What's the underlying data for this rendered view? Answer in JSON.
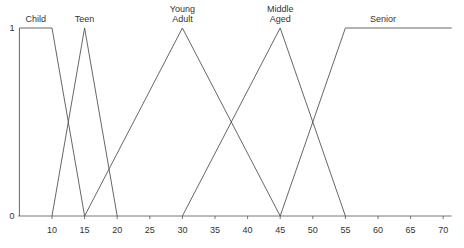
{
  "chart_data": {
    "type": "line",
    "title": "",
    "xlabel": "",
    "ylabel": "",
    "xlim": [
      4.8,
      71.3
    ],
    "ylim": [
      0,
      1
    ],
    "grid": false,
    "legend": "none (series labeled inline above peaks)",
    "x_ticks": [
      10,
      15,
      20,
      25,
      30,
      35,
      40,
      45,
      50,
      55,
      60,
      65,
      70
    ],
    "y_ticks": [
      0,
      1
    ],
    "series": [
      {
        "name": "Child",
        "label_lines": [
          "Child"
        ],
        "points": [
          [
            5,
            0
          ],
          [
            5,
            1
          ],
          [
            10,
            1
          ],
          [
            15,
            0
          ]
        ]
      },
      {
        "name": "Teen",
        "label_lines": [
          "Teen"
        ],
        "points": [
          [
            10,
            0
          ],
          [
            15,
            1
          ],
          [
            20,
            0
          ]
        ]
      },
      {
        "name": "Young Adult",
        "label_lines": [
          "Young",
          "Adult"
        ],
        "points": [
          [
            15,
            0
          ],
          [
            30,
            1
          ],
          [
            45,
            0
          ]
        ]
      },
      {
        "name": "Middle Aged",
        "label_lines": [
          "Middle",
          "Aged"
        ],
        "points": [
          [
            30,
            0
          ],
          [
            45,
            1
          ],
          [
            55,
            0
          ]
        ]
      },
      {
        "name": "Senior",
        "label_lines": [
          "Senior"
        ],
        "points": [
          [
            45,
            0
          ],
          [
            55,
            1
          ],
          [
            71.3,
            1
          ]
        ]
      }
    ]
  },
  "style": {
    "line_color": "#555555",
    "axis_color": "#555555",
    "text_color": "#333333",
    "background": "#ffffff"
  }
}
